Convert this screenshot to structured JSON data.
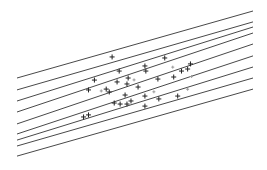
{
  "chart_data": {
    "type": "scatter",
    "title": "",
    "xlabel": "",
    "ylabel": "",
    "axes_visible": false,
    "grid": false,
    "legend": "none",
    "xlim": [
      0,
      100
    ],
    "ylim": [
      0,
      100
    ],
    "series": [
      {
        "name": "points",
        "marker": "+",
        "points": [
          {
            "x": 40.3,
            "y": 66.5
          },
          {
            "x": 43.3,
            "y": 58.2
          },
          {
            "x": 32.8,
            "y": 52.9
          },
          {
            "x": 42.4,
            "y": 51.8
          },
          {
            "x": 62.6,
            "y": 65.9
          },
          {
            "x": 54.2,
            "y": 61.2
          },
          {
            "x": 54.6,
            "y": 58.2
          },
          {
            "x": 73.5,
            "y": 62.4
          },
          {
            "x": 72.3,
            "y": 59.4
          },
          {
            "x": 69.7,
            "y": 58.2
          },
          {
            "x": 66.4,
            "y": 54.7
          },
          {
            "x": 59.7,
            "y": 53.5
          },
          {
            "x": 47.1,
            "y": 54.1
          },
          {
            "x": 37.8,
            "y": 47.6
          },
          {
            "x": 30.3,
            "y": 47.1
          },
          {
            "x": 45.8,
            "y": 44.1
          },
          {
            "x": 39.1,
            "y": 45.9
          },
          {
            "x": 43.7,
            "y": 38.8
          },
          {
            "x": 41.2,
            "y": 39.4
          },
          {
            "x": 46.6,
            "y": 38.8
          },
          {
            "x": 48.3,
            "y": 40.6
          },
          {
            "x": 54.2,
            "y": 43.5
          },
          {
            "x": 60.1,
            "y": 41.8
          },
          {
            "x": 54.2,
            "y": 37.6
          },
          {
            "x": 68.1,
            "y": 43.5
          },
          {
            "x": 30.3,
            "y": 32.4
          },
          {
            "x": 28.2,
            "y": 31.2
          },
          {
            "x": 51.3,
            "y": 48.8
          },
          {
            "x": 46.6,
            "y": 50.6
          }
        ],
        "faint_points": [
          {
            "x": 49.6,
            "y": 53.0
          },
          {
            "x": 58.0,
            "y": 46.0
          },
          {
            "x": 72.3,
            "y": 47.5
          },
          {
            "x": 74.0,
            "y": 55.0
          },
          {
            "x": 66.0,
            "y": 60.5
          },
          {
            "x": 35.7,
            "y": 46.5
          }
        ]
      },
      {
        "name": "fitted lines",
        "type": "line",
        "lines": [
          {
            "x": [
              0,
              100
            ],
            "y": [
              54.1,
              93.5
            ]
          },
          {
            "x": [
              0,
              100
            ],
            "y": [
              47.1,
              87.1
            ]
          },
          {
            "x": [
              0,
              100
            ],
            "y": [
              40.6,
              84.1
            ]
          },
          {
            "x": [
              0,
              100
            ],
            "y": [
              34.1,
              80.6
            ]
          },
          {
            "x": [
              0,
              100
            ],
            "y": [
              27.1,
              74.1
            ]
          },
          {
            "x": [
              0,
              100
            ],
            "y": [
              21.2,
              67.1
            ]
          },
          {
            "x": [
              0,
              100
            ],
            "y": [
              17.6,
              60.6
            ]
          },
          {
            "x": [
              0,
              100
            ],
            "y": [
              14.1,
              54.1
            ]
          },
          {
            "x": [
              0,
              100
            ],
            "y": [
              8.2,
              47.6
            ]
          }
        ]
      }
    ]
  }
}
